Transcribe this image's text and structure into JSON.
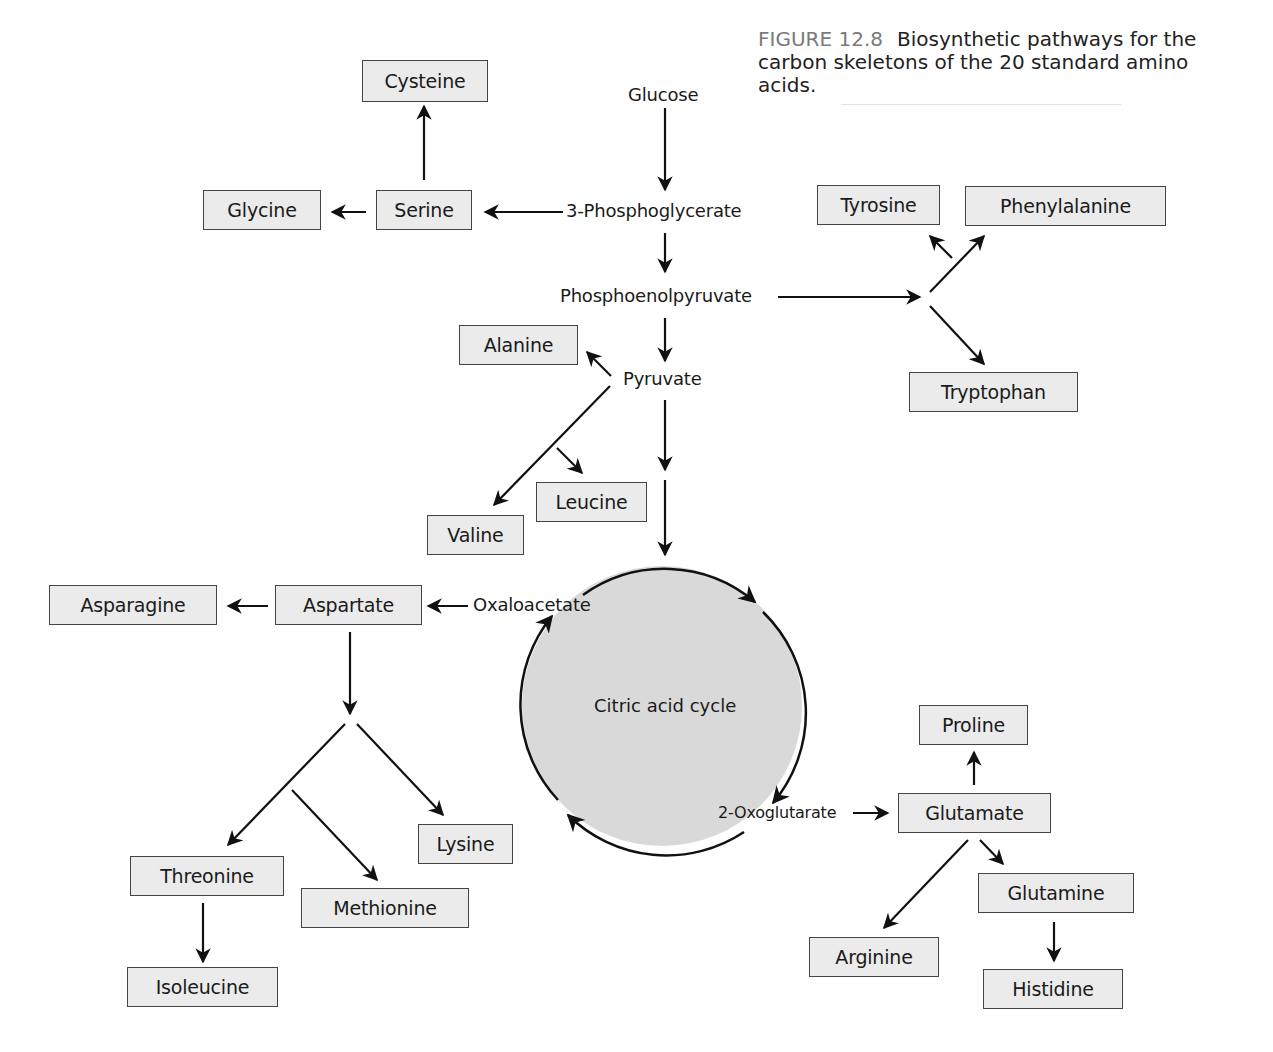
{
  "caption": {
    "figure_number": "FIGURE 12.8",
    "text": "Biosynthetic pathways for the carbon skeletons of the 20 standard amino acids."
  },
  "intermediates": {
    "glucose": "Glucose",
    "phosphoglycerate": "3-Phosphoglycerate",
    "pep": "Phosphoenolpyruvate",
    "pyruvate": "Pyruvate",
    "oxaloacetate": "Oxaloacetate",
    "oxoglutarate": "2-Oxoglutarate",
    "cycle": "Citric acid cycle"
  },
  "amino_acids": {
    "cysteine": "Cysteine",
    "glycine": "Glycine",
    "serine": "Serine",
    "tyrosine": "Tyrosine",
    "phenylalanine": "Phenylalanine",
    "tryptophan": "Tryptophan",
    "alanine": "Alanine",
    "leucine": "Leucine",
    "valine": "Valine",
    "asparagine": "Asparagine",
    "aspartate": "Aspartate",
    "threonine": "Threonine",
    "methionine": "Methionine",
    "lysine": "Lysine",
    "isoleucine": "Isoleucine",
    "proline": "Proline",
    "glutamate": "Glutamate",
    "glutamine": "Glutamine",
    "arginine": "Arginine",
    "histidine": "Histidine"
  },
  "colors": {
    "box_fill": "#ebebeb",
    "box_border": "#444444",
    "cycle_fill": "#d9d9d9",
    "arrow": "#111111",
    "figure_label": "#7a7a7a"
  }
}
